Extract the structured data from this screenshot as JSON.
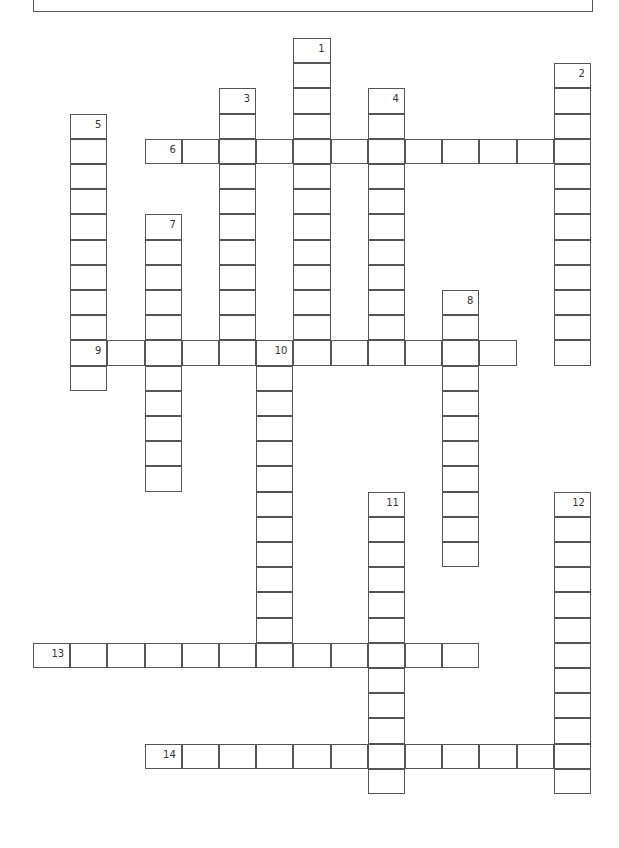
{
  "puzzle": {
    "type": "crossword",
    "grid": {
      "origin_x": 33,
      "origin_y": 38,
      "cell_w": 37.2,
      "cell_h": 25.2
    },
    "entries": [
      {
        "number": "1",
        "direction": "down",
        "row": 0,
        "col": 7,
        "length": 12
      },
      {
        "number": "2",
        "direction": "down",
        "row": 1,
        "col": 14,
        "length": 12
      },
      {
        "number": "3",
        "direction": "down",
        "row": 2,
        "col": 5,
        "length": 11
      },
      {
        "number": "4",
        "direction": "down",
        "row": 2,
        "col": 9,
        "length": 11
      },
      {
        "number": "5",
        "direction": "down",
        "row": 3,
        "col": 1,
        "length": 11
      },
      {
        "number": "6",
        "direction": "across",
        "row": 4,
        "col": 3,
        "length": 12
      },
      {
        "number": "7",
        "direction": "down",
        "row": 7,
        "col": 3,
        "length": 11
      },
      {
        "number": "8",
        "direction": "down",
        "row": 10,
        "col": 11,
        "length": 11
      },
      {
        "number": "9",
        "direction": "across",
        "row": 12,
        "col": 1,
        "length": 12
      },
      {
        "number": "10",
        "direction": "down",
        "row": 12,
        "col": 6,
        "length": 13
      },
      {
        "number": "11",
        "direction": "down",
        "row": 18,
        "col": 9,
        "length": 12
      },
      {
        "number": "12",
        "direction": "down",
        "row": 18,
        "col": 14,
        "length": 12
      },
      {
        "number": "13",
        "direction": "across",
        "row": 24,
        "col": 0,
        "length": 12
      },
      {
        "number": "14",
        "direction": "across",
        "row": 28,
        "col": 3,
        "length": 12
      }
    ]
  }
}
